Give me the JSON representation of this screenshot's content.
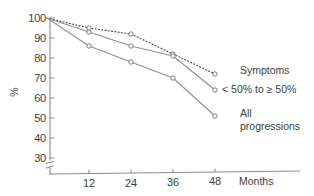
{
  "chart_data": {
    "type": "line",
    "title": "",
    "subtitle": "",
    "xlabel": "Months",
    "ylabel": "%",
    "x": [
      0,
      12,
      24,
      36,
      48
    ],
    "xticks": [
      12,
      24,
      36,
      48
    ],
    "xtick_labels": [
      "12",
      "24",
      "36",
      "48"
    ],
    "yticks": [
      30,
      40,
      50,
      60,
      70,
      80,
      90,
      100
    ],
    "ytick_labels": [
      "30",
      "40",
      "50",
      "60",
      "70",
      "80",
      "90",
      "100"
    ],
    "ylim": [
      30,
      100
    ],
    "xlim": [
      0,
      52
    ],
    "axis_break": true,
    "grid": false,
    "legend_position": "right-inline",
    "series": [
      {
        "name": "Symptoms",
        "label_lines": [
          "Symptoms"
        ],
        "style": "dotted",
        "color": "#4a4a4a",
        "values": [
          100,
          95,
          92,
          82,
          72
        ]
      },
      {
        "name": "< 50% to ≥ 50%",
        "label_lines": [
          "< 50% to ≥ 50%"
        ],
        "style": "solid",
        "color": "#8f8f8f",
        "values": [
          100,
          93,
          86,
          81,
          64
        ]
      },
      {
        "name": "All progressions",
        "label_lines": [
          "All",
          "progressions"
        ],
        "style": "solid",
        "color": "#8f8f8f",
        "values": [
          100,
          86,
          78,
          70,
          51
        ]
      }
    ],
    "annotations": []
  },
  "labels": {
    "ylabel": "%",
    "xlabel": "Months",
    "series_symptoms": "Symptoms",
    "series_partial": "< 50% to ≥ 50%",
    "series_all_line1": "All",
    "series_all_line2": "progressions",
    "ytick_100": "100",
    "ytick_90": "90",
    "ytick_80": "80",
    "ytick_70": "70",
    "ytick_60": "60",
    "ytick_50": "50",
    "ytick_40": "40",
    "ytick_30": "30",
    "xtick_12": "12",
    "xtick_24": "24",
    "xtick_36": "36",
    "xtick_48": "48"
  },
  "colors": {
    "axis": "#8a8a8a",
    "text": "#3d3d3d",
    "solid_series": "#8f8f8f",
    "dotted_series": "#4a4a4a",
    "background": "#ffffff"
  }
}
